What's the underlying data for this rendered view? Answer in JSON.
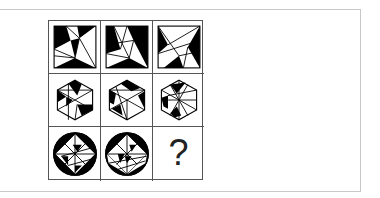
{
  "puzzle": {
    "grid_rows": 3,
    "grid_cols": 3,
    "row_shapes": [
      "square",
      "hexagon",
      "circle"
    ],
    "missing_cell": {
      "row": 3,
      "col": 3,
      "label": "?"
    }
  }
}
